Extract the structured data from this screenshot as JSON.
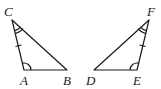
{
  "diagram": {
    "type": "congruent-triangles",
    "stroke_color": "#1a1a1a",
    "triangle_1": {
      "vertices": {
        "C": {
          "x": 12,
          "y": 20,
          "label": "C"
        },
        "A": {
          "x": 24,
          "y": 70,
          "label": "A"
        },
        "B": {
          "x": 67,
          "y": 70,
          "label": "B"
        }
      },
      "marks": {
        "double_arc_at": "C",
        "single_arc_at": "A",
        "tick_on_side": "CA"
      }
    },
    "triangle_2": {
      "vertices": {
        "F": {
          "x": 149,
          "y": 20,
          "label": "F"
        },
        "E": {
          "x": 137,
          "y": 70,
          "label": "E"
        },
        "D": {
          "x": 94,
          "y": 70,
          "label": "D"
        }
      },
      "marks": {
        "double_arc_at": "F",
        "single_arc_at": "E",
        "tick_on_side": "FE"
      }
    }
  }
}
